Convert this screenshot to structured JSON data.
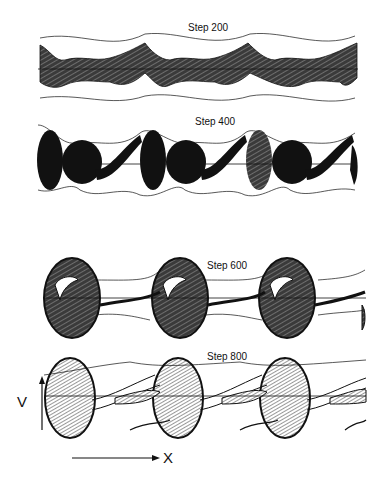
{
  "figure": {
    "panels": [
      {
        "label": "Step 200",
        "top": 20,
        "label_x": 188,
        "label_y": 22
      },
      {
        "label": "Step 400",
        "top": 118,
        "label_x": 195,
        "label_y": 120
      },
      {
        "label": "Step 600",
        "top": 255,
        "label_x": 207,
        "label_y": 262
      },
      {
        "label": "Step 800",
        "top": 350,
        "label_x": 207,
        "label_y": 353
      }
    ],
    "axes": {
      "v_label": "V",
      "x_label": "X"
    },
    "colors": {
      "ink": "#111111",
      "hatch": "#444444",
      "background": "#ffffff"
    }
  }
}
